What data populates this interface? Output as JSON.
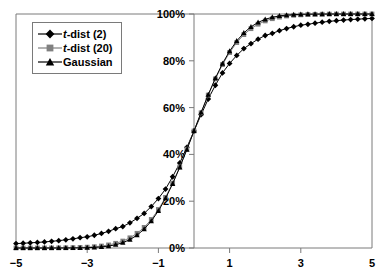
{
  "chart_data": {
    "type": "line",
    "title": "",
    "subtitle": "",
    "xlabel": "",
    "ylabel": "",
    "xlim": [
      -5,
      5
    ],
    "ylim": [
      0,
      1
    ],
    "grid": false,
    "legend_position": "top-left",
    "xticks": [
      -5,
      -3,
      -1,
      1,
      3,
      5
    ],
    "xticklabels": [
      "−5",
      "−3",
      "−1",
      "1",
      "3",
      "5"
    ],
    "yticks": [
      0,
      0.2,
      0.4,
      0.6,
      0.8,
      1.0
    ],
    "yticklabels": [
      "0%",
      "20%",
      "40%",
      "60%",
      "80%",
      "100%"
    ],
    "x": [
      -5,
      -4.8,
      -4.6,
      -4.4,
      -4.2,
      -4,
      -3.8,
      -3.6,
      -3.4,
      -3.2,
      -3,
      -2.8,
      -2.6,
      -2.4,
      -2.2,
      -2,
      -1.8,
      -1.6,
      -1.4,
      -1.2,
      -1,
      -0.8,
      -0.6,
      -0.4,
      -0.2,
      0,
      0.2,
      0.4,
      0.6,
      0.8,
      1,
      1.2,
      1.4,
      1.6,
      1.8,
      2,
      2.2,
      2.4,
      2.6,
      2.8,
      3,
      3.2,
      3.4,
      3.6,
      3.8,
      4,
      4.2,
      4.4,
      4.6,
      4.8,
      5
    ],
    "series": [
      {
        "name": "t-dist (2)",
        "marker": "diamond",
        "color": "#000000",
        "values": [
          0.0189,
          0.0203,
          0.022,
          0.0238,
          0.0259,
          0.0286,
          0.0315,
          0.035,
          0.0391,
          0.044,
          0.0477,
          0.0545,
          0.0621,
          0.0713,
          0.0826,
          0.0918,
          0.1074,
          0.1268,
          0.1478,
          0.1772,
          0.2113,
          0.2518,
          0.3045,
          0.3632,
          0.4302,
          0.5,
          0.5698,
          0.6368,
          0.6955,
          0.7482,
          0.7887,
          0.8228,
          0.8522,
          0.8732,
          0.8926,
          0.9082,
          0.9174,
          0.9287,
          0.9379,
          0.9455,
          0.9523,
          0.956,
          0.9609,
          0.965,
          0.9685,
          0.9714,
          0.9741,
          0.9762,
          0.978,
          0.9797,
          0.9811
        ]
      },
      {
        "name": "t-dist (20)",
        "marker": "square",
        "color": "#808080",
        "values": [
          3e-05,
          5e-05,
          8e-05,
          0.00012,
          0.00019,
          0.00035,
          0.00056,
          0.0009,
          0.00144,
          0.0023,
          0.00354,
          0.00546,
          0.00846,
          0.01317,
          0.02008,
          0.02963,
          0.0435,
          0.06271,
          0.08806,
          0.12205,
          0.16462,
          0.21632,
          0.27745,
          0.34646,
          0.42217,
          0.5,
          0.57783,
          0.65354,
          0.72255,
          0.78368,
          0.83538,
          0.87795,
          0.91194,
          0.93729,
          0.9565,
          0.97037,
          0.97992,
          0.98683,
          0.99154,
          0.99454,
          0.99646,
          0.9977,
          0.99856,
          0.9991,
          0.99944,
          0.99965,
          0.99981,
          0.99988,
          0.99992,
          0.99995,
          0.99997
        ]
      },
      {
        "name": "Gaussian",
        "marker": "triangle",
        "color": "#000000",
        "values": [
          3e-07,
          8e-07,
          2.1e-06,
          5.4e-06,
          1.33e-05,
          3.17e-05,
          7.23e-05,
          0.000159,
          0.000337,
          0.000687,
          0.00135,
          0.00256,
          0.00466,
          0.0082,
          0.0139,
          0.02275,
          0.03593,
          0.0548,
          0.08076,
          0.11507,
          0.15866,
          0.21186,
          0.27425,
          0.34458,
          0.42074,
          0.5,
          0.57926,
          0.65542,
          0.72575,
          0.78814,
          0.84134,
          0.88493,
          0.91924,
          0.9452,
          0.96407,
          0.97725,
          0.9861,
          0.9918,
          0.99534,
          0.99744,
          0.99865,
          0.99931,
          0.99966,
          0.99984,
          0.99993,
          0.99997,
          0.99999,
          0.99999,
          1.0,
          1.0,
          1.0
        ]
      }
    ]
  },
  "legend": {
    "items": [
      {
        "prefix": "t",
        "suffix": "-dist (2)",
        "marker": "diamond-icon"
      },
      {
        "prefix": "t",
        "suffix": "-dist (20)",
        "marker": "square-icon"
      },
      {
        "prefix": "",
        "suffix": "Gaussian",
        "marker": "triangle-icon"
      }
    ]
  },
  "colors": {
    "frame": "#7a7a7a",
    "axis": "#7a7a7a",
    "curve_dark": "#000000",
    "curve_gray": "#808080",
    "background": "#ffffff"
  }
}
